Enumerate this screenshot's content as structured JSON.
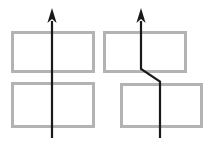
{
  "figure": {
    "type": "diagram",
    "width": 214,
    "height": 143,
    "background_color": "#ffffff",
    "title": "",
    "box_stroke_color": "#b3b3b3",
    "box_fill_color": "#ffffff",
    "box_stroke_width": 3,
    "arrow_color": "#1a1a1a",
    "arrow_stroke_width": 2.2,
    "boxes": [
      {
        "name": "top-left-box",
        "label": "",
        "x": 11,
        "y": 31,
        "w": 84,
        "h": 42
      },
      {
        "name": "top-right-box",
        "label": "",
        "x": 103,
        "y": 31,
        "w": 84,
        "h": 42
      },
      {
        "name": "bottom-left-box",
        "label": "",
        "x": 11,
        "y": 82,
        "w": 84,
        "h": 46
      },
      {
        "name": "bottom-right-box",
        "label": "",
        "x": 120,
        "y": 83,
        "w": 83,
        "h": 45
      }
    ],
    "arrows": [
      {
        "name": "left-arrow",
        "label": "",
        "path": "M 52,138 L 52,21",
        "head_tip_x": 52,
        "head_tip_y": 8,
        "head_base_y": 23,
        "head_half_width": 4.6
      },
      {
        "name": "right-arrow",
        "label": "",
        "path": "M 160,138 L 160,81.5 L 141,69 L 141,21",
        "head_tip_x": 141,
        "head_tip_y": 8,
        "head_base_y": 23,
        "head_half_width": 4.6
      }
    ]
  }
}
